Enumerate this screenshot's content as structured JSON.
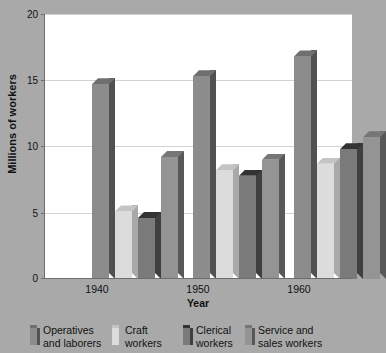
{
  "chart_data": {
    "type": "bar",
    "title": "",
    "xlabel": "Year",
    "ylabel": "Millions of workers",
    "categories": [
      "1940",
      "1950",
      "1960"
    ],
    "yticks": [
      0,
      5,
      10,
      15,
      20
    ],
    "ylim": [
      0,
      20
    ],
    "grid": true,
    "legend_position": "bottom",
    "series": [
      {
        "name": "Operatives and laborers",
        "color": "#8c8c8c",
        "side_color": "#515151",
        "top_color": "#6f6f6f",
        "values": [
          14.7,
          15.3,
          16.8
        ]
      },
      {
        "name": "Craft workers",
        "color": "#dcdcdc",
        "side_color": "#a9a9a9",
        "top_color": "#c4c4c4",
        "values": [
          5.1,
          8.2,
          8.7
        ]
      },
      {
        "name": "Clerical workers",
        "color": "#7a7a7a",
        "side_color": "#3f3f3f",
        "top_color": "#333333",
        "values": [
          4.6,
          7.8,
          9.8
        ]
      },
      {
        "name": "Service and sales workers",
        "color": "#949494",
        "side_color": "#585858",
        "top_color": "#767676",
        "values": [
          9.2,
          9.0,
          10.7
        ]
      }
    ]
  },
  "axes": {
    "y_title": "Millions of workers",
    "x_title": "Year",
    "y_tick_labels": [
      "0",
      "5",
      "10",
      "15",
      "20"
    ],
    "x_tick_labels": [
      "1940",
      "1950",
      "1960"
    ]
  },
  "legend": {
    "items": [
      {
        "label": "Operatives\nand laborers",
        "swatch": "#8c8c8c",
        "swatch_side": "#515151",
        "swatch_top": "#6f6f6f"
      },
      {
        "label": "Craft\nworkers",
        "swatch": "#dcdcdc",
        "swatch_side": "#a9a9a9",
        "swatch_top": "#c4c4c4"
      },
      {
        "label": "Clerical\nworkers",
        "swatch": "#7a7a7a",
        "swatch_side": "#3f3f3f",
        "swatch_top": "#333333"
      },
      {
        "label": "Service and\nsales workers",
        "swatch": "#949494",
        "swatch_side": "#585858",
        "swatch_top": "#767676"
      }
    ]
  },
  "colors": {
    "page_background": "#a9a9a9",
    "plot_background": "#ffffff",
    "gridline": "#d2d2d2",
    "axis": "#6d6d6d",
    "text": "#111111"
  }
}
